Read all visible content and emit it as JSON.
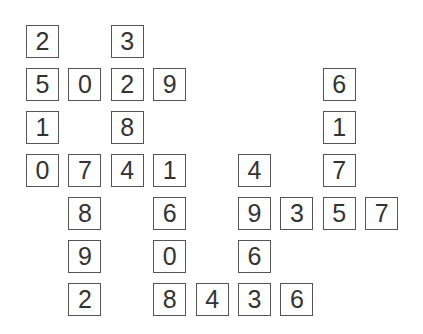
{
  "puzzle": {
    "type": "number-crossword-fill",
    "cells": [
      {
        "row": 0,
        "col": 0,
        "value": "2"
      },
      {
        "row": 0,
        "col": 2,
        "value": "3"
      },
      {
        "row": 1,
        "col": 0,
        "value": "5"
      },
      {
        "row": 1,
        "col": 1,
        "value": "0"
      },
      {
        "row": 1,
        "col": 2,
        "value": "2"
      },
      {
        "row": 1,
        "col": 3,
        "value": "9"
      },
      {
        "row": 1,
        "col": 7,
        "value": "6"
      },
      {
        "row": 2,
        "col": 0,
        "value": "1"
      },
      {
        "row": 2,
        "col": 2,
        "value": "8"
      },
      {
        "row": 2,
        "col": 7,
        "value": "1"
      },
      {
        "row": 3,
        "col": 0,
        "value": "0"
      },
      {
        "row": 3,
        "col": 1,
        "value": "7"
      },
      {
        "row": 3,
        "col": 2,
        "value": "4"
      },
      {
        "row": 3,
        "col": 3,
        "value": "1"
      },
      {
        "row": 3,
        "col": 5,
        "value": "4"
      },
      {
        "row": 3,
        "col": 7,
        "value": "7"
      },
      {
        "row": 4,
        "col": 1,
        "value": "8"
      },
      {
        "row": 4,
        "col": 3,
        "value": "6"
      },
      {
        "row": 4,
        "col": 5,
        "value": "9"
      },
      {
        "row": 4,
        "col": 6,
        "value": "3"
      },
      {
        "row": 4,
        "col": 7,
        "value": "5"
      },
      {
        "row": 4,
        "col": 8,
        "value": "7"
      },
      {
        "row": 5,
        "col": 1,
        "value": "9"
      },
      {
        "row": 5,
        "col": 3,
        "value": "0"
      },
      {
        "row": 5,
        "col": 5,
        "value": "6"
      },
      {
        "row": 6,
        "col": 1,
        "value": "2"
      },
      {
        "row": 6,
        "col": 3,
        "value": "8"
      },
      {
        "row": 6,
        "col": 4,
        "value": "4"
      },
      {
        "row": 6,
        "col": 5,
        "value": "3"
      },
      {
        "row": 6,
        "col": 6,
        "value": "6"
      }
    ]
  }
}
